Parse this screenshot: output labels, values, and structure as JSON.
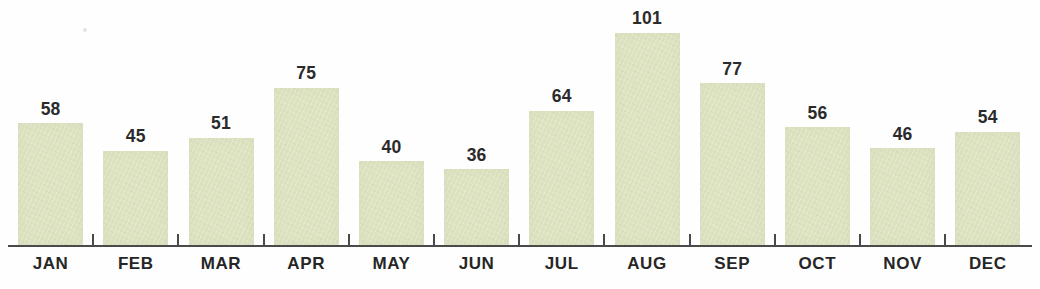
{
  "chart_data": {
    "type": "bar",
    "title": "",
    "subtitle": "",
    "xlabel": "",
    "ylabel": "",
    "categories": [
      "JAN",
      "FEB",
      "MAR",
      "APR",
      "MAY",
      "JUN",
      "JUL",
      "AUG",
      "SEP",
      "OCT",
      "NOV",
      "DEC"
    ],
    "values": [
      58,
      45,
      51,
      75,
      40,
      36,
      64,
      101,
      77,
      56,
      46,
      54
    ],
    "value_labels": [
      "58",
      "45",
      "51",
      "75",
      "40",
      "36",
      "64",
      "101",
      "77",
      "56",
      "46",
      "54"
    ],
    "ylim": [
      0,
      101
    ],
    "grid": false,
    "legend": null,
    "legend_position": "none",
    "data_labels_shown": true,
    "axis": {
      "x_axis_visible": true,
      "y_axis_visible": false,
      "tick_marks_between_categories": true,
      "tick_label_count": 12
    }
  },
  "colors": {
    "bar_fill": "#dde3c0",
    "axis": "#4a4a4a",
    "value_label": "#2b2b2b",
    "category_label": "#262626",
    "background": "#fefefe"
  }
}
